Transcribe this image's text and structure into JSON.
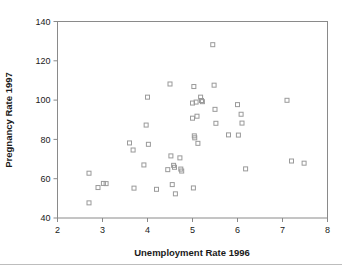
{
  "figure": {
    "background_color": "#ffffff",
    "frame_color": "#8a8a8a",
    "marker_color": "#9a9a9a",
    "text_color": "#1a1a1a"
  },
  "chart_data": {
    "type": "scatter",
    "title": "",
    "xlabel": "Unemployment Rate 1996",
    "ylabel": "Pregnancy Rate 1997",
    "xlim": [
      2,
      8
    ],
    "ylim": [
      40,
      140
    ],
    "xticks": [
      2,
      3,
      4,
      5,
      6,
      7,
      8
    ],
    "yticks": [
      40,
      60,
      80,
      100,
      120,
      140
    ],
    "xtick_labels": [
      "2",
      "3",
      "4",
      "5",
      "6",
      "7",
      "8"
    ],
    "ytick_labels": [
      "40",
      "60",
      "80",
      "100",
      "120",
      "140"
    ],
    "grid": false,
    "legend": false,
    "marker": "open-square",
    "series": [
      {
        "name": "States",
        "points": [
          [
            2.7,
            62.8
          ],
          [
            2.7,
            47.7
          ],
          [
            2.9,
            55.5
          ],
          [
            3.02,
            57.6
          ],
          [
            3.08,
            57.5
          ],
          [
            3.6,
            78.2
          ],
          [
            3.68,
            74.6
          ],
          [
            3.7,
            55.2
          ],
          [
            3.92,
            67.0
          ],
          [
            3.97,
            87.3
          ],
          [
            4.0,
            101.5
          ],
          [
            4.02,
            77.5
          ],
          [
            4.2,
            54.6
          ],
          [
            4.45,
            64.6
          ],
          [
            4.5,
            108.2
          ],
          [
            4.52,
            71.6
          ],
          [
            4.55,
            57.0
          ],
          [
            4.58,
            66.8
          ],
          [
            4.6,
            65.8
          ],
          [
            4.62,
            52.3
          ],
          [
            4.72,
            70.6
          ],
          [
            4.74,
            64.9
          ],
          [
            4.76,
            63.9
          ],
          [
            5.0,
            90.8
          ],
          [
            5.0,
            98.5
          ],
          [
            5.02,
            55.3
          ],
          [
            5.03,
            106.9
          ],
          [
            5.04,
            81.8
          ],
          [
            5.05,
            80.8
          ],
          [
            5.08,
            99.0
          ],
          [
            5.1,
            91.8
          ],
          [
            5.12,
            78.0
          ],
          [
            5.18,
            101.5
          ],
          [
            5.2,
            99.8
          ],
          [
            5.22,
            99.2
          ],
          [
            5.45,
            128.2
          ],
          [
            5.48,
            107.6
          ],
          [
            5.5,
            95.3
          ],
          [
            5.52,
            88.2
          ],
          [
            5.8,
            82.3
          ],
          [
            6.0,
            97.7
          ],
          [
            6.02,
            82.2
          ],
          [
            6.08,
            92.8
          ],
          [
            6.1,
            88.3
          ],
          [
            6.18,
            65.0
          ],
          [
            7.1,
            99.9
          ],
          [
            7.2,
            69.0
          ],
          [
            7.48,
            67.9
          ]
        ]
      }
    ]
  }
}
